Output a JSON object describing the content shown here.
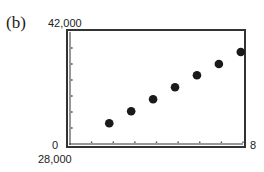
{
  "panel_label": "(b)",
  "axes": {
    "ymax_label": "42,000",
    "ymin_label": "0",
    "xmin_label": "28,000",
    "xmax_label": "8"
  },
  "chart_data": {
    "type": "scatter",
    "title": "(b)",
    "xlabel": "",
    "ylabel": "",
    "xlim": [
      0,
      8
    ],
    "ylim": [
      28000,
      42000
    ],
    "x_tick_step": 1,
    "y_tick_step": 2000,
    "grid": false,
    "x": [
      2,
      3,
      4,
      5,
      6,
      7,
      8
    ],
    "y": [
      30600,
      32100,
      33600,
      35100,
      36600,
      38000,
      39500
    ],
    "annotations": [
      "42,000 (Ymax)",
      "0 (Xmin)",
      "28,000 (Ymin)",
      "8 (Xmax)"
    ]
  }
}
